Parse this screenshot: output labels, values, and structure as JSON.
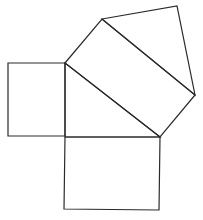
{
  "diagram": {
    "title": "",
    "stroke_color": "#2a2a2a",
    "background": "#ffffff",
    "shapes": [
      {
        "name": "square-on-left-leg",
        "points": [
          [
            8,
            63
          ],
          [
            65,
            63
          ],
          [
            65,
            136
          ],
          [
            8,
            136
          ]
        ]
      },
      {
        "name": "square-on-bottom-leg",
        "points": [
          [
            65,
            137
          ],
          [
            160,
            137
          ],
          [
            159,
            210
          ],
          [
            64,
            209
          ]
        ]
      },
      {
        "name": "square-on-hypotenuse",
        "points": [
          [
            65,
            63
          ],
          [
            102,
            19
          ],
          [
            195,
            95
          ],
          [
            160,
            137
          ]
        ]
      },
      {
        "name": "right-triangle",
        "points": [
          [
            65,
            63
          ],
          [
            65,
            137
          ],
          [
            160,
            137
          ]
        ]
      },
      {
        "name": "top-triangle",
        "points": [
          [
            102,
            19
          ],
          [
            177,
            6
          ],
          [
            195,
            95
          ]
        ]
      }
    ]
  }
}
